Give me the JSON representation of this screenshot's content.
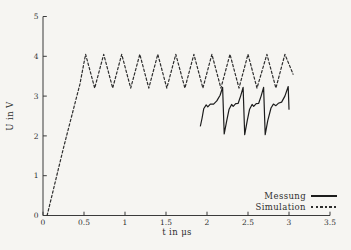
{
  "figure": {
    "background": "#f6f5f2",
    "axis_color": "#3b3b3b",
    "line_color_measurement": "#1c1c1c",
    "line_color_simulation": "#2d2d2d"
  },
  "chart_data": {
    "type": "line",
    "title": "",
    "xlabel": "t in μs",
    "ylabel": "U in V",
    "xlim": [
      0,
      3.5
    ],
    "ylim": [
      0,
      5
    ],
    "x_ticks": [
      0,
      0.5,
      1,
      1.5,
      2,
      2.5,
      3,
      3.5
    ],
    "x_tick_labels": [
      "0",
      "0.5",
      "1",
      "1.5",
      "2",
      "2.5",
      "3",
      "3.5"
    ],
    "y_ticks": [
      0,
      1,
      2,
      3,
      4,
      5
    ],
    "y_tick_labels": [
      "0",
      "1",
      "2",
      "3",
      "4",
      "5"
    ],
    "grid": false,
    "legend_position": "bottom-right",
    "series": [
      {
        "name": "Messung",
        "style": "solid",
        "color": "#1c1c1c",
        "points": [
          [
            1.92,
            2.25
          ],
          [
            1.94,
            2.45
          ],
          [
            1.96,
            2.68
          ],
          [
            1.99,
            2.78
          ],
          [
            2.01,
            2.73
          ],
          [
            2.04,
            2.8
          ],
          [
            2.08,
            2.8
          ],
          [
            2.12,
            2.88
          ],
          [
            2.16,
            3.02
          ],
          [
            2.19,
            3.22
          ],
          [
            2.21,
            2.05
          ],
          [
            2.24,
            2.38
          ],
          [
            2.27,
            2.67
          ],
          [
            2.3,
            2.79
          ],
          [
            2.32,
            2.74
          ],
          [
            2.35,
            2.81
          ],
          [
            2.38,
            2.82
          ],
          [
            2.41,
            3.0
          ],
          [
            2.44,
            3.22
          ],
          [
            2.46,
            2.03
          ],
          [
            2.49,
            2.38
          ],
          [
            2.52,
            2.67
          ],
          [
            2.55,
            2.79
          ],
          [
            2.57,
            2.74
          ],
          [
            2.6,
            2.81
          ],
          [
            2.63,
            2.82
          ],
          [
            2.66,
            3.0
          ],
          [
            2.69,
            3.22
          ],
          [
            2.71,
            2.03
          ],
          [
            2.74,
            2.38
          ],
          [
            2.78,
            2.7
          ],
          [
            2.81,
            2.8
          ],
          [
            2.84,
            2.76
          ],
          [
            2.87,
            2.82
          ],
          [
            2.91,
            2.85
          ],
          [
            2.95,
            3.0
          ],
          [
            2.99,
            3.24
          ],
          [
            3.0,
            2.67
          ]
        ]
      },
      {
        "name": "Simulation",
        "style": "dashed",
        "color": "#2d2d2d",
        "points": [
          [
            0.05,
            0
          ],
          [
            0.15,
            0.85
          ],
          [
            0.25,
            1.7
          ],
          [
            0.35,
            2.5
          ],
          [
            0.45,
            3.3
          ],
          [
            0.52,
            4.05
          ],
          [
            0.63,
            3.2
          ],
          [
            0.74,
            4.05
          ],
          [
            0.85,
            3.2
          ],
          [
            0.96,
            4.05
          ],
          [
            1.07,
            3.2
          ],
          [
            1.18,
            4.05
          ],
          [
            1.29,
            3.2
          ],
          [
            1.4,
            4.05
          ],
          [
            1.51,
            3.2
          ],
          [
            1.62,
            4.05
          ],
          [
            1.73,
            3.2
          ],
          [
            1.84,
            4.05
          ],
          [
            1.95,
            3.2
          ],
          [
            2.06,
            4.05
          ],
          [
            2.17,
            3.2
          ],
          [
            2.28,
            4.05
          ],
          [
            2.39,
            3.2
          ],
          [
            2.5,
            4.05
          ],
          [
            2.61,
            3.2
          ],
          [
            2.73,
            4.05
          ],
          [
            2.84,
            3.2
          ],
          [
            2.95,
            4.05
          ],
          [
            3.05,
            3.55
          ]
        ]
      }
    ]
  }
}
